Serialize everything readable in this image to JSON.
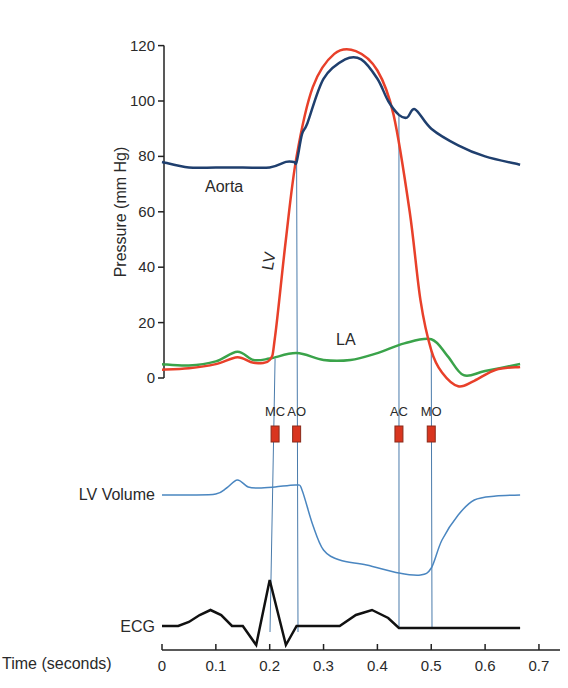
{
  "chart_data": {
    "type": "line",
    "title": "",
    "pressure_panel": {
      "ylabel": "Pressure (mm Hg)",
      "ylim": [
        0,
        120
      ],
      "yticks": [
        0,
        20,
        40,
        60,
        80,
        100,
        120
      ],
      "grid": false,
      "series": [
        {
          "name": "Aorta",
          "color": "#1f3f6e",
          "x": [
            0,
            0.05,
            0.1,
            0.15,
            0.2,
            0.23,
            0.245,
            0.25,
            0.26,
            0.27,
            0.3,
            0.34,
            0.37,
            0.4,
            0.42,
            0.44,
            0.455,
            0.47,
            0.5,
            0.55,
            0.6,
            0.665
          ],
          "y": [
            78,
            76,
            76,
            76,
            76,
            78,
            78,
            78,
            88,
            92,
            108,
            115,
            115,
            108,
            100,
            95,
            94,
            97,
            90,
            84,
            80,
            77
          ]
        },
        {
          "name": "LV",
          "color": "#e8402a",
          "x": [
            0,
            0.05,
            0.1,
            0.14,
            0.17,
            0.2,
            0.21,
            0.23,
            0.25,
            0.28,
            0.32,
            0.36,
            0.4,
            0.43,
            0.46,
            0.48,
            0.5,
            0.52,
            0.55,
            0.58,
            0.62,
            0.665
          ],
          "y": [
            3,
            3.5,
            5,
            7.5,
            5.5,
            6.5,
            15,
            50,
            80,
            105,
            117,
            118,
            111,
            95,
            60,
            28,
            10,
            2,
            -3,
            -1,
            3,
            4
          ]
        },
        {
          "name": "LA",
          "color": "#3aa34a",
          "x": [
            0,
            0.05,
            0.1,
            0.14,
            0.17,
            0.2,
            0.25,
            0.3,
            0.35,
            0.4,
            0.45,
            0.5,
            0.53,
            0.56,
            0.6,
            0.665
          ],
          "y": [
            5,
            4.5,
            6,
            9.5,
            6.5,
            7,
            9,
            6.5,
            6.5,
            9,
            12.5,
            14,
            8,
            1,
            2.5,
            5
          ]
        }
      ],
      "annotations": [
        {
          "text": "Aorta",
          "x": 0.12,
          "y": 82
        },
        {
          "text": "LV",
          "x": 0.215,
          "y": 45,
          "rotated": true
        },
        {
          "text": "LA",
          "x": 0.35,
          "y": 15
        }
      ]
    },
    "valve_events": [
      {
        "label": "MC",
        "time": 0.21
      },
      {
        "label": "AO",
        "time": 0.25
      },
      {
        "label": "AC",
        "time": 0.44
      },
      {
        "label": "MO",
        "time": 0.5
      }
    ],
    "lv_volume_panel": {
      "label": "LV Volume",
      "color": "#4a86c0",
      "x": [
        0,
        0.05,
        0.1,
        0.12,
        0.14,
        0.16,
        0.18,
        0.21,
        0.25,
        0.26,
        0.28,
        0.3,
        0.33,
        0.38,
        0.44,
        0.48,
        0.5,
        0.52,
        0.55,
        0.58,
        0.62,
        0.665
      ],
      "y_px": [
        495,
        495,
        494,
        488,
        480,
        487,
        488,
        487,
        485,
        490,
        525,
        550,
        560,
        565,
        573,
        575,
        568,
        540,
        515,
        500,
        496,
        495
      ]
    },
    "ecg_panel": {
      "label": "ECG",
      "color": "#111111",
      "x": [
        0,
        0.03,
        0.05,
        0.07,
        0.09,
        0.11,
        0.13,
        0.15,
        0.175,
        0.2,
        0.23,
        0.25,
        0.3,
        0.33,
        0.36,
        0.39,
        0.42,
        0.44,
        0.5,
        0.6,
        0.665
      ],
      "y_px": [
        626,
        626,
        622,
        615,
        610,
        615,
        626,
        626,
        645,
        580,
        645,
        626,
        626,
        626,
        615,
        610,
        618,
        628,
        628,
        628,
        628
      ]
    },
    "time_axis": {
      "xlabel": "Time (seconds)",
      "xlim": [
        0,
        0.7
      ],
      "xticks": [
        0,
        0.1,
        0.2,
        0.3,
        0.4,
        0.5,
        0.6,
        0.7
      ],
      "xtick_labels": [
        "0",
        "0.1",
        "0.2",
        "0.3",
        "0.4",
        "0.5",
        "0.6",
        "0.7"
      ]
    },
    "legend": null
  },
  "labels": {
    "pressure_ylabel": "Pressure (mm Hg)",
    "aorta": "Aorta",
    "lv": "LV",
    "la": "LA",
    "lv_volume": "LV Volume",
    "ecg": "ECG",
    "time_xlabel": "Time (seconds)"
  }
}
